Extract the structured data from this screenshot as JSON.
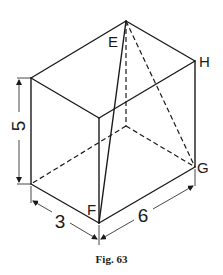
{
  "figure": {
    "caption": "Fig. 63",
    "vertex_labels": {
      "E": "E",
      "F": "F",
      "G": "G",
      "H": "H"
    },
    "dimensions": {
      "height": "5",
      "depth": "3",
      "width": "6"
    }
  }
}
